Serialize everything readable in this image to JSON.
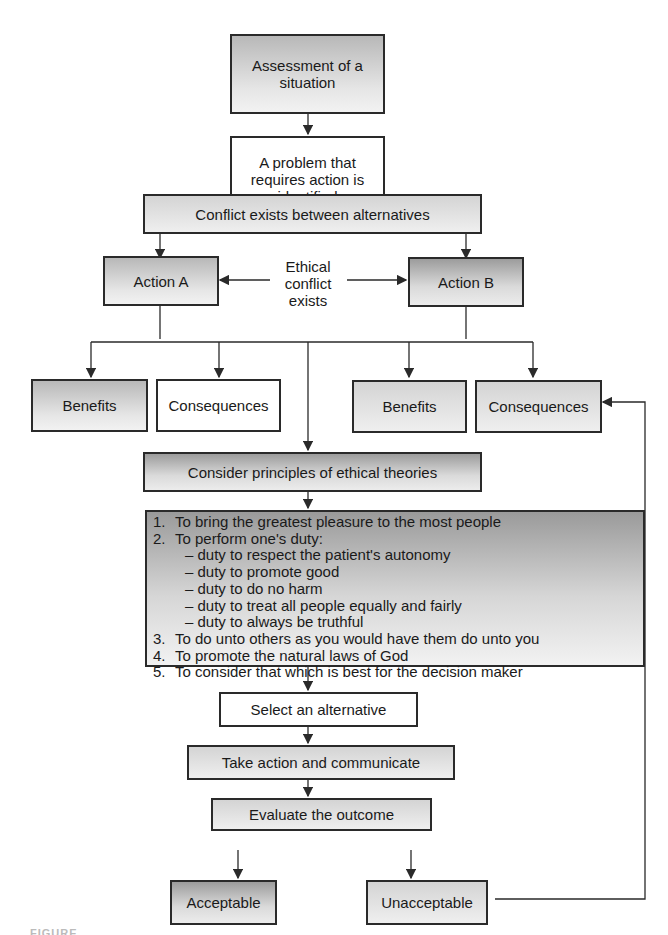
{
  "diagram": {
    "nodes": {
      "assessment": "Assessment of a situation",
      "problem": "A problem that requires action is identified",
      "conflict": "Conflict exists between alternatives",
      "action_a": "Action A",
      "action_b": "Action B",
      "ethical_conflict": "Ethical conflict exists",
      "benefits_a": "Benefits",
      "consequences_a": "Consequences",
      "benefits_b": "Benefits",
      "consequences_b": "Consequences",
      "consider": "Consider principles of ethical theories",
      "select": "Select an alternative",
      "take_action": "Take action and communicate",
      "evaluate": "Evaluate the outcome",
      "acceptable": "Acceptable",
      "unacceptable": "Unacceptable"
    },
    "principles": [
      {
        "num": "1.",
        "text": "To bring the greatest pleasure to the most people"
      },
      {
        "num": "2.",
        "text": "To perform one's duty:"
      },
      {
        "sub": "– duty to respect the patient's autonomy"
      },
      {
        "sub": "– duty to promote good"
      },
      {
        "sub": "– duty to do no harm"
      },
      {
        "sub": "– duty to treat all people equally and fairly"
      },
      {
        "sub": "– duty to always be truthful"
      },
      {
        "num": "3.",
        "text": "To do unto others as you would have them do unto you"
      },
      {
        "num": "4.",
        "text": "To promote the natural laws of God"
      },
      {
        "num": "5.",
        "text": "To consider that which is best for the decision maker"
      }
    ],
    "caption": "FIGURE"
  }
}
